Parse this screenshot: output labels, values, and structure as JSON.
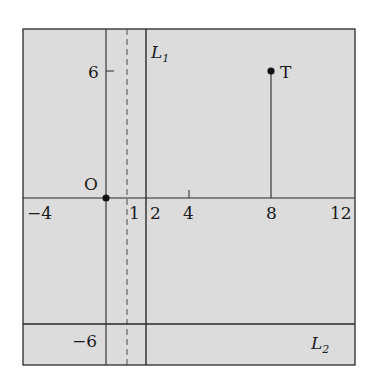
{
  "diagram": {
    "background_color": "#ffffff",
    "plot_fill_color": "#dcdcdc",
    "line_color": "#2a2a2a",
    "frame": {
      "x_min": -4,
      "x_max": 12,
      "y_min": -6.4,
      "y_max": 8
    },
    "x_axis": {
      "tick_labels": [
        "−4",
        "1",
        "2",
        "4",
        "8",
        "12"
      ],
      "tick_values": [
        -4,
        1,
        2,
        4,
        8,
        12
      ]
    },
    "y_axis": {
      "tick_labels": [
        "6",
        "−6"
      ],
      "tick_values": [
        6,
        -6
      ]
    },
    "points": [
      {
        "name": "O",
        "label": "O",
        "x": 0,
        "y": 0
      },
      {
        "name": "T",
        "label": "T",
        "x": 8,
        "y": 6
      }
    ],
    "lines": [
      {
        "name": "L1",
        "label": "L",
        "subscript": "1",
        "type": "vertical",
        "x": 2,
        "style": "solid"
      },
      {
        "name": "L2",
        "label": "L",
        "subscript": "2",
        "type": "horizontal",
        "y": -6,
        "style": "solid"
      },
      {
        "name": "x=1",
        "type": "vertical",
        "x": 1,
        "style": "dashed"
      }
    ],
    "segments": [
      {
        "name": "T-drop",
        "from": [
          8,
          0
        ],
        "to": [
          8,
          6
        ]
      }
    ]
  }
}
